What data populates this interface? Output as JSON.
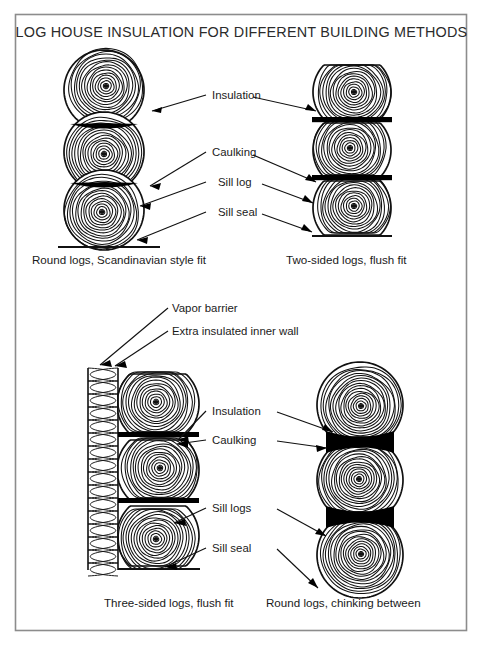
{
  "figure": {
    "title": "LOG HOUSE INSULATION FOR DIFFERENT BUILDING METHODS",
    "background_color": "#ffffff",
    "frame_color": "#8c8c8c",
    "ink_color": "#111111",
    "chinking_color": "#000000"
  },
  "panels": [
    {
      "id": "top-left",
      "caption": "Round logs, Scandinavian style fit",
      "log_style": "round",
      "log_count": 3,
      "joint_style": "scribed-caulk",
      "has_sill_seal_line": true,
      "has_inner_wall": false,
      "labels": [
        {
          "key": "insulation",
          "text": "Insulation"
        },
        {
          "key": "caulking",
          "text": "Caulking"
        },
        {
          "key": "sill_log",
          "text": "Sill log"
        },
        {
          "key": "sill_seal",
          "text": "Sill seal"
        }
      ]
    },
    {
      "id": "top-right",
      "caption": "Two-sided logs, flush fit",
      "log_style": "two-sided",
      "log_count": 3,
      "joint_style": "flush-caulk",
      "has_sill_seal_line": true,
      "has_inner_wall": false,
      "labels": []
    },
    {
      "id": "bottom-left",
      "caption": "Three-sided logs, flush fit",
      "log_style": "three-sided",
      "log_count": 3,
      "joint_style": "flush-caulk",
      "has_sill_seal_line": true,
      "has_inner_wall": true,
      "labels": [
        {
          "key": "vapor_barrier",
          "text": "Vapor barrier"
        },
        {
          "key": "inner_wall",
          "text": "Extra insulated inner wall"
        },
        {
          "key": "insulation",
          "text": "Insulation"
        },
        {
          "key": "caulking",
          "text": "Caulking"
        },
        {
          "key": "sill_logs",
          "text": "Sill logs"
        },
        {
          "key": "sill_seal",
          "text": "Sill seal"
        }
      ]
    },
    {
      "id": "bottom-right",
      "caption": "Round logs, chinking between",
      "log_style": "round",
      "log_count": 3,
      "joint_style": "chinking",
      "has_sill_seal_line": false,
      "has_inner_wall": false,
      "labels": []
    }
  ],
  "label_text": {
    "insulation": "Insulation",
    "caulking": "Caulking",
    "sill_log": "Sill log",
    "sill_seal": "Sill seal",
    "sill_logs": "Sill logs",
    "vapor_barrier": "Vapor barrier",
    "inner_wall": "Extra insulated inner wall"
  },
  "captions": {
    "top_left": "Round logs, Scandinavian style fit",
    "top_right": "Two-sided logs, flush fit",
    "bottom_left": "Three-sided logs, flush fit",
    "bottom_right": "Round logs, chinking between"
  }
}
